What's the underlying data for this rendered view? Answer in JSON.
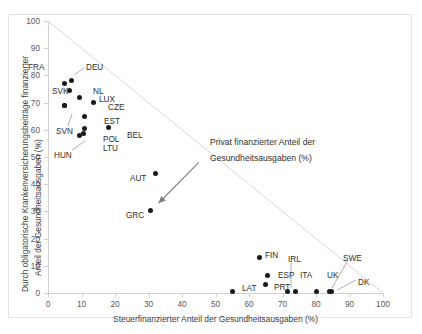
{
  "chart_data": {
    "type": "scatter",
    "title": "",
    "xlabel": "Steuerfinanzierter Anteil der Gesundheitsausgaben (%)",
    "ylabel_line1": "Durch obligatorische Krankenversicherungsbeiträge finanzierter",
    "ylabel_line2": "Anteil der Gesundheitsausgaben (%)",
    "xlim": [
      0,
      100
    ],
    "ylim": [
      0,
      100
    ],
    "xticks": [
      0,
      10,
      20,
      30,
      40,
      50,
      60,
      70,
      80,
      90,
      100
    ],
    "yticks": [
      0,
      10,
      20,
      30,
      40,
      50,
      60,
      70,
      80,
      90,
      100
    ],
    "grid": false,
    "legend": "none",
    "reference_line": {
      "label": "x + y = 100",
      "from": [
        0,
        100
      ],
      "to": [
        100,
        0
      ],
      "color": "#d9d9d9"
    },
    "annotations": [
      {
        "text_line1": "Privat finanzierter Anteil der",
        "text_line2": "Gesundheitsausgaben (%)",
        "arrow_from": [
          45,
          48
        ],
        "arrow_to": [
          33,
          33
        ],
        "color": "#808080"
      }
    ],
    "points": [
      {
        "label": "FRA",
        "x": 5.0,
        "y": 77.0
      },
      {
        "label": "DEU",
        "x": 7.0,
        "y": 78.0
      },
      {
        "label": "SVK",
        "x": 6.5,
        "y": 74.5
      },
      {
        "label": "NL",
        "x": 9.5,
        "y": 72.0
      },
      {
        "label": "LUX",
        "x": 5.0,
        "y": 69.0
      },
      {
        "label": "CZE",
        "x": 13.5,
        "y": 70.0
      },
      {
        "label": "SVN",
        "x": 5.0,
        "y": 69.0
      },
      {
        "label": "EST",
        "x": 11.0,
        "y": 65.0
      },
      {
        "label": "POL",
        "x": 11.0,
        "y": 60.5
      },
      {
        "label": "BEL",
        "x": 18.0,
        "y": 61.0
      },
      {
        "label": "LTU",
        "x": 10.5,
        "y": 58.5
      },
      {
        "label": "HUN",
        "x": 9.5,
        "y": 58.0
      },
      {
        "label": "AUT",
        "x": 32.0,
        "y": 44.0
      },
      {
        "label": "GRC",
        "x": 30.5,
        "y": 30.5
      },
      {
        "label": "FIN",
        "x": 63.0,
        "y": 13.0
      },
      {
        "label": "ESP",
        "x": 65.5,
        "y": 6.5
      },
      {
        "label": "PRT",
        "x": 65.0,
        "y": 3.0
      },
      {
        "label": "IRL",
        "x": 71.5,
        "y": 0.5
      },
      {
        "label": "ITA",
        "x": 74.0,
        "y": 0.5
      },
      {
        "label": "LAT",
        "x": 55.0,
        "y": 0.5
      },
      {
        "label": "UK",
        "x": 80.0,
        "y": 0.5
      },
      {
        "label": "SWE",
        "x": 84.0,
        "y": 0.5
      },
      {
        "label": "DK",
        "x": 84.5,
        "y": 0.5
      }
    ],
    "point_labels": [
      {
        "label": "FRA",
        "lx": 28,
        "ly": 64,
        "leader": null
      },
      {
        "label": "DEU",
        "lx": 86,
        "ly": 64,
        "leader": [
          [
            84,
            68
          ],
          [
            74,
            75
          ]
        ]
      },
      {
        "label": "SVK",
        "lx": 52,
        "ly": 88,
        "leader": null
      },
      {
        "label": "NL",
        "lx": 93,
        "ly": 88,
        "leader": null
      },
      {
        "label": "LUX",
        "lx": 99,
        "ly": 96,
        "leader": null
      },
      {
        "label": "CZE",
        "lx": 108,
        "ly": 104,
        "leader": null
      },
      {
        "label": "SVN",
        "lx": 56,
        "ly": 128,
        "leader": [
          [
            68,
            126
          ],
          [
            72,
            114
          ]
        ]
      },
      {
        "label": "EST",
        "lx": 104,
        "ly": 118,
        "leader": null
      },
      {
        "label": "POL",
        "lx": 103,
        "ly": 136,
        "leader": null
      },
      {
        "label": "BEL",
        "lx": 127,
        "ly": 132,
        "leader": null
      },
      {
        "label": "LTU",
        "lx": 103,
        "ly": 145,
        "leader": null
      },
      {
        "label": "HUN",
        "lx": 54,
        "ly": 152,
        "leader": [
          [
            72,
            150
          ],
          [
            85,
            141
          ]
        ]
      },
      {
        "label": "AUT",
        "lx": 130,
        "ly": 175,
        "leader": null
      },
      {
        "label": "GRC",
        "lx": 126,
        "ly": 212,
        "leader": null
      },
      {
        "label": "FIN",
        "lx": 265,
        "ly": 252,
        "leader": null
      },
      {
        "label": "ESP",
        "lx": 278,
        "ly": 272,
        "leader": null
      },
      {
        "label": "PRT",
        "lx": 274,
        "ly": 284,
        "leader": null
      },
      {
        "label": "IRL",
        "lx": 288,
        "ly": 256,
        "leader": [
          [
            291,
            261
          ],
          [
            291,
            288
          ]
        ]
      },
      {
        "label": "ITA",
        "lx": 300,
        "ly": 272,
        "leader": null
      },
      {
        "label": "LAT",
        "lx": 242,
        "ly": 285,
        "leader": null
      },
      {
        "label": "UK",
        "lx": 327,
        "ly": 272,
        "leader": null
      },
      {
        "label": "SWE",
        "lx": 343,
        "ly": 255,
        "leader": [
          [
            348,
            260
          ],
          [
            332,
            288
          ]
        ]
      },
      {
        "label": "DK",
        "lx": 358,
        "ly": 279,
        "leader": [
          [
            356,
            280
          ],
          [
            337,
            290
          ]
        ]
      }
    ]
  }
}
